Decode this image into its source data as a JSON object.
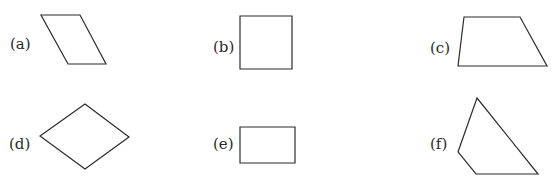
{
  "figure": {
    "type": "quadrilateral identification figure",
    "stroke_color": "#2b2b2b",
    "shapes": [
      {
        "label": "(a)",
        "kind": "parallelogram",
        "points": "41,15 80,15 106,64 68,64",
        "label_pos": [
          10,
          37
        ]
      },
      {
        "label": "(b)",
        "kind": "square",
        "points": "240,16 292,16 292,69 240,69",
        "label_pos": [
          213,
          40
        ]
      },
      {
        "label": "(c)",
        "kind": "trapezium",
        "points": "464,17 520,17 547,66 458,66",
        "label_pos": [
          430,
          41
        ]
      },
      {
        "label": "(d)",
        "kind": "rhombus",
        "points": "85,104 129,137 85,169 40,136",
        "label_pos": [
          9,
          137
        ]
      },
      {
        "label": "(e)",
        "kind": "rectangle",
        "points": "240,127 295,127 295,163 240,163",
        "label_pos": [
          213,
          137
        ]
      },
      {
        "label": "(f)",
        "kind": "quadrilateral",
        "points": "477,98 538,174 476,174 458,152",
        "label_pos": [
          430,
          137
        ]
      }
    ]
  }
}
